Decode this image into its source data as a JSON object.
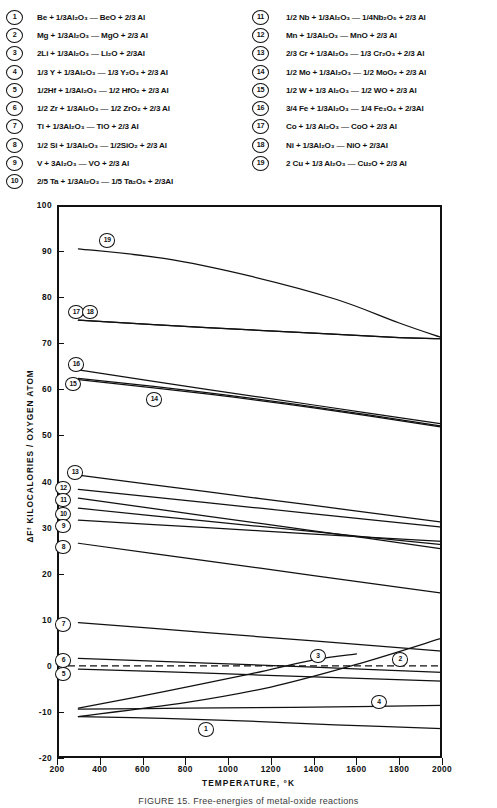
{
  "legend": {
    "left": [
      {
        "n": "1",
        "eq": "Be + 1/3Al₂O₃  —  BeO + 2/3 Al"
      },
      {
        "n": "2",
        "eq": "Mg + 1/3Al₂O₃ — MgO + 2/3 Al"
      },
      {
        "n": "3",
        "eq": "2Li + 1/3Al₂O₃ — Li₂O + 2/3Al"
      },
      {
        "n": "4",
        "eq": "1/3 Y + 1/3Al₂O₃  —  1/3 Y₂O₃ + 2/3 Al"
      },
      {
        "n": "5",
        "eq": "1/2Hf + 1/3Al₂O₃ — 1/2 HfO₂ + 2/3 Al"
      },
      {
        "n": "6",
        "eq": "1/2 Zr + 1/3Al₂O₃ — 1/2 ZrO₂ + 2/3 Al"
      },
      {
        "n": "7",
        "eq": "Ti + 1/3Al₂O₃  —  TiO + 2/3 Al"
      },
      {
        "n": "8",
        "eq": "1/2 Si + 1/3Al₂O₃ — 1/2SiO₂ + 2/3 Al"
      },
      {
        "n": "9",
        "eq": "V + 3Al₂O₃  —  VO + 2/3 Al"
      },
      {
        "n": "10",
        "eq": "2/5 Ta + 1/3Al₂O₃ — 1/5 Ta₂O₅ + 2/3Al"
      }
    ],
    "right": [
      {
        "n": "11",
        "eq": "1/2 Nb + 1/3Al₂O₃  —  1/4Nb₂O₅ + 2/3 Al"
      },
      {
        "n": "12",
        "eq": "Mn + 1/3Al₂O₃ — MnO + 2/3 Al"
      },
      {
        "n": "13",
        "eq": "2/3 Cr + 1/3Al₂O₃  —  1/3 Cr₂O₃ + 2/3 Al"
      },
      {
        "n": "14",
        "eq": "1/2 Mo + 1/3Al₂O₃  —  1/2 MoO₂ + 2/3 Al"
      },
      {
        "n": "15",
        "eq": "1/2 W + 1/3 Al₂O₃ — 1/2 WO + 2/3 Al"
      },
      {
        "n": "16",
        "eq": "3/4 Fe + 1/3Al₂O₃ — 1/4 Fe₃O₄ + 2/3Al"
      },
      {
        "n": "17",
        "eq": "Co + 1/3 Al₂O₃  —  CoO + 2/3 Al"
      },
      {
        "n": "18",
        "eq": "Ni + 1/3Al₂O₃ — NiO + 2/3Al"
      },
      {
        "n": "19",
        "eq": "2 Cu + 1/3 Al₂O₃ — Cu₂O + 2/3 Al"
      }
    ]
  },
  "chart_data": {
    "type": "line",
    "title": "",
    "xlabel": "TEMPERATURE, °K",
    "ylabel": "ΔFᶠ KILOCALORIES / OXYGEN ATOM",
    "xlim": [
      200,
      2000
    ],
    "ylim": [
      -20,
      100
    ],
    "xticks": [
      200,
      400,
      600,
      800,
      1000,
      1200,
      1400,
      1600,
      1800,
      2000
    ],
    "yticks": [
      -20,
      -10,
      0,
      10,
      20,
      30,
      40,
      50,
      60,
      70,
      80,
      90,
      100
    ],
    "grid": false,
    "zero_reference_line": 0,
    "legend_position": "inline-markers",
    "series": [
      {
        "name": "1",
        "label": "BeO",
        "x": [
          300,
          700,
          1100,
          1500,
          2000
        ],
        "y": [
          -11.0,
          -11.4,
          -12.0,
          -12.8,
          -13.6
        ]
      },
      {
        "name": "2",
        "label": "MgO",
        "x": [
          300,
          800,
          1200,
          1600,
          2000
        ],
        "y": [
          -11.0,
          -8.0,
          -4.6,
          0.3,
          6.0
        ]
      },
      {
        "name": "3",
        "label": "Li2O",
        "x": [
          300,
          700,
          1100,
          1400,
          1600
        ],
        "y": [
          -9.2,
          -5.6,
          -1.8,
          1.3,
          2.6
        ]
      },
      {
        "name": "4",
        "label": "Y2O3",
        "x": [
          300,
          800,
          1300,
          1700,
          2000
        ],
        "y": [
          -9.4,
          -9.2,
          -9.0,
          -8.8,
          -8.6
        ]
      },
      {
        "name": "5",
        "label": "HfO2",
        "x": [
          300,
          900,
          1400,
          2000
        ],
        "y": [
          -0.7,
          -1.6,
          -2.4,
          -3.3
        ]
      },
      {
        "name": "6",
        "label": "ZrO2",
        "x": [
          300,
          900,
          1400,
          2000
        ],
        "y": [
          1.6,
          0.6,
          -0.3,
          -1.4
        ]
      },
      {
        "name": "7",
        "label": "TiO",
        "x": [
          300,
          900,
          1400,
          2000
        ],
        "y": [
          9.4,
          7.2,
          5.4,
          3.2
        ]
      },
      {
        "name": "8",
        "label": "SiO2",
        "x": [
          300,
          900,
          1400,
          2000
        ],
        "y": [
          26.6,
          22.8,
          19.6,
          15.8
        ]
      },
      {
        "name": "9",
        "label": "VO",
        "x": [
          300,
          900,
          1400,
          2000
        ],
        "y": [
          31.6,
          30.0,
          28.6,
          27.0
        ]
      },
      {
        "name": "10",
        "label": "Ta2O5",
        "x": [
          300,
          900,
          1400,
          2000
        ],
        "y": [
          34.2,
          31.4,
          29.1,
          26.3
        ]
      },
      {
        "name": "11",
        "label": "Nb2O5",
        "x": [
          300,
          900,
          1400,
          2000
        ],
        "y": [
          36.4,
          32.5,
          29.3,
          25.4
        ]
      },
      {
        "name": "12",
        "label": "MnO",
        "x": [
          300,
          900,
          1400,
          2000
        ],
        "y": [
          38.3,
          35.4,
          33.0,
          30.1
        ]
      },
      {
        "name": "13",
        "label": "Cr2O3",
        "x": [
          300,
          900,
          1400,
          2000
        ],
        "y": [
          41.4,
          37.8,
          34.8,
          31.2
        ]
      },
      {
        "name": "14",
        "label": "MoO2",
        "x": [
          300,
          900,
          1400,
          2000
        ],
        "y": [
          62.4,
          59.3,
          56.2,
          52.0
        ]
      },
      {
        "name": "15",
        "label": "WO",
        "x": [
          300,
          900,
          1400,
          2000
        ],
        "y": [
          62.1,
          59.0,
          56.0,
          51.8
        ]
      },
      {
        "name": "16",
        "label": "Fe3O4",
        "x": [
          300,
          900,
          1400,
          2000
        ],
        "y": [
          64.2,
          60.0,
          56.6,
          52.5
        ]
      },
      {
        "name": "17",
        "label": "CoO",
        "x": [
          300,
          900,
          1400,
          1800,
          2000
        ],
        "y": [
          75.0,
          73.4,
          72.2,
          71.2,
          71.0
        ]
      },
      {
        "name": "18",
        "label": "NiO",
        "x": [
          300,
          900,
          1400,
          1800,
          2000
        ],
        "y": [
          75.0,
          73.4,
          72.2,
          71.2,
          71.0
        ]
      },
      {
        "name": "19",
        "label": "Cu2O",
        "x": [
          300,
          700,
          1100,
          1500,
          1800,
          2000
        ],
        "y": [
          90.5,
          88.4,
          84.6,
          79.6,
          74.4,
          71.2
        ]
      }
    ],
    "curve_markers": [
      {
        "n": "19",
        "x": 430,
        "y": 92.5
      },
      {
        "n": "17",
        "x": 285,
        "y": 77.0
      },
      {
        "n": "18",
        "x": 350,
        "y": 77.0
      },
      {
        "n": "16",
        "x": 285,
        "y": 65.6
      },
      {
        "n": "15",
        "x": 270,
        "y": 61.4
      },
      {
        "n": "14",
        "x": 650,
        "y": 58.0
      },
      {
        "n": "13",
        "x": 280,
        "y": 42.2
      },
      {
        "n": "12",
        "x": 225,
        "y": 38.8
      },
      {
        "n": "11",
        "x": 225,
        "y": 36.2
      },
      {
        "n": "10",
        "x": 225,
        "y": 33.2
      },
      {
        "n": "9",
        "x": 225,
        "y": 30.6
      },
      {
        "n": "8",
        "x": 225,
        "y": 26.0
      },
      {
        "n": "7",
        "x": 225,
        "y": 9.2
      },
      {
        "n": "6",
        "x": 225,
        "y": 1.4
      },
      {
        "n": "5",
        "x": 225,
        "y": -1.6
      },
      {
        "n": "3",
        "x": 1415,
        "y": 2.4
      },
      {
        "n": "2",
        "x": 1800,
        "y": 1.6
      },
      {
        "n": "4",
        "x": 1700,
        "y": -7.6
      },
      {
        "n": "1",
        "x": 890,
        "y": -13.6
      }
    ]
  },
  "caption": "FIGURE 15.  Free-energies of metal-oxide reactions"
}
